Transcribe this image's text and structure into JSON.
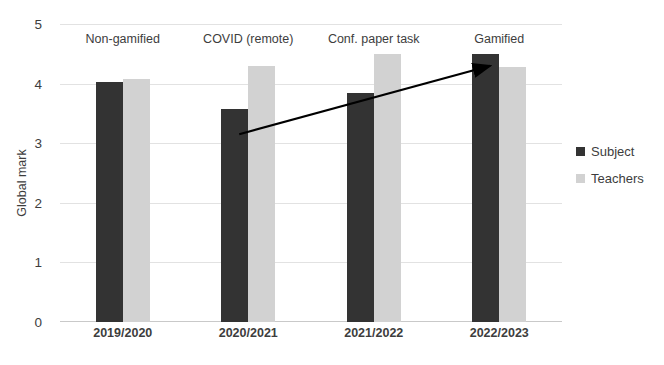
{
  "chart_data": {
    "type": "bar",
    "title": "",
    "subtitle": "",
    "xlabel": "",
    "ylabel": "Global mark",
    "ylim": [
      0,
      5
    ],
    "ytick_labels": [
      "0",
      "1",
      "2",
      "3",
      "4",
      "5"
    ],
    "ytick_values": [
      0,
      1,
      2,
      3,
      4,
      5
    ],
    "grid": true,
    "legend_position": "right",
    "categories": [
      "2019/2020",
      "2020/2021",
      "2021/2022",
      "2022/2023"
    ],
    "series": [
      {
        "name": "Subject",
        "color": "#333333",
        "values": [
          4.03,
          3.57,
          3.85,
          4.5
        ]
      },
      {
        "name": "Teachers",
        "color": "#d2d2d2",
        "values": [
          4.08,
          4.29,
          4.5,
          4.28
        ]
      }
    ],
    "annotations": [
      {
        "text": "Non-gamified",
        "category": "2019/2020"
      },
      {
        "text": "COVID (remote)",
        "category": "2020/2021"
      },
      {
        "text": "Conf. paper task",
        "category": "2021/2022"
      },
      {
        "text": "Gamified",
        "category": "2022/2023"
      }
    ],
    "trend_arrow": {
      "from": {
        "category": "2020/2021",
        "value": 3.15
      },
      "to": {
        "category": "2022/2023",
        "value": 4.3
      },
      "color": "#000000"
    }
  },
  "legend": {
    "items": [
      {
        "label": "Subject",
        "swatch": "subject-swatch"
      },
      {
        "label": "Teachers",
        "swatch": "teachers-swatch"
      }
    ]
  },
  "axis": {
    "y_title": "Global mark"
  }
}
